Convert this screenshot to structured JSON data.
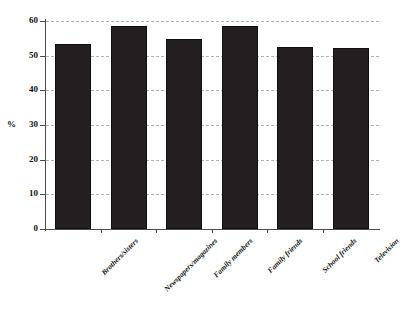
{
  "chart_data": {
    "type": "bar",
    "title": "",
    "xlabel": "",
    "ylabel": "%",
    "ylim": [
      0,
      60
    ],
    "ytick_step": 10,
    "yticks": [
      60,
      50,
      40,
      30,
      20,
      10,
      0
    ],
    "grid": true,
    "legend": "none",
    "bar_color": "#231f20",
    "categories": [
      "Brothers/sisters",
      "Newspapers/magazines",
      "Family members",
      "Family friends",
      "School friends",
      "Television"
    ],
    "values": [
      53.5,
      58.5,
      54.8,
      58.5,
      52.4,
      52.1
    ]
  },
  "axis": {
    "y_title": "%",
    "tick_labels": [
      "60",
      "50",
      "40",
      "30",
      "20",
      "10",
      "0"
    ]
  }
}
